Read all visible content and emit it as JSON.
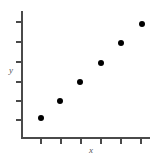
{
  "figure": {
    "width": 162,
    "height": 160,
    "background_color": "#ffffff"
  },
  "chart_data": {
    "type": "scatter",
    "title": "",
    "xlabel": "x",
    "ylabel": "y",
    "x": [
      1,
      2,
      3,
      4,
      5,
      6
    ],
    "y": [
      1,
      2,
      3.2,
      4.5,
      5.6,
      6.6
    ],
    "series": [
      {
        "name": "",
        "x": [
          1,
          2,
          3,
          4,
          5,
          6
        ],
        "y": [
          1,
          2,
          3.2,
          4.5,
          5.6,
          6.6
        ]
      }
    ],
    "xlim": [
      0,
      7
    ],
    "ylim": [
      0,
      7
    ],
    "xticks": [
      1,
      2,
      3,
      4,
      5,
      6
    ],
    "yticks": [
      1,
      2,
      3,
      4,
      5,
      6
    ],
    "xticklabels": [
      "",
      "",
      "",
      "",
      "",
      ""
    ],
    "yticklabels": [
      "",
      "",
      "",
      "",
      "",
      ""
    ],
    "grid": false,
    "legend": false,
    "marker": "filled-circle",
    "marker_color": "#000000",
    "marker_size_px": 6,
    "axis_color": "#4a4a4a",
    "points_px": [
      {
        "cx": 41,
        "cy": 118
      },
      {
        "cx": 60,
        "cy": 101
      },
      {
        "cx": 80,
        "cy": 82
      },
      {
        "cx": 101,
        "cy": 63
      },
      {
        "cx": 121,
        "cy": 43
      },
      {
        "cx": 142,
        "cy": 24
      }
    ],
    "xtick_px": [
      41,
      61,
      81,
      101,
      121,
      141
    ],
    "ytick_px": [
      22,
      42,
      62,
      82,
      101,
      120
    ],
    "axes_px": {
      "x_left": 22,
      "x_right": 150,
      "y_top": 11,
      "y_bottom": 138
    },
    "label_positions_px": {
      "xlabel": {
        "x": 91,
        "y": 153
      },
      "ylabel": {
        "x": 11,
        "y": 73
      }
    }
  }
}
